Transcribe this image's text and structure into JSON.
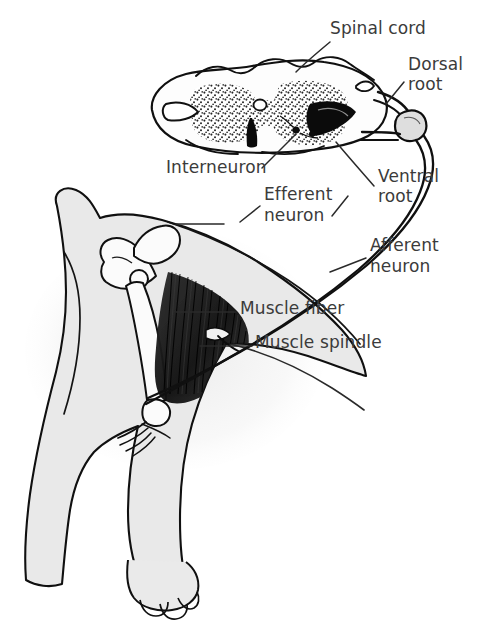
{
  "figure": {
    "width": 499,
    "height": 643,
    "background": "#ffffff",
    "style": "black-and-white line drawing with stipple shading"
  },
  "colors": {
    "outline": "#101010",
    "label_text": "#3b3b3b",
    "body_fill": "#e9e9e9",
    "bone_fill": "#fbfbfb",
    "cord_fill": "#fdfdfd",
    "gray_matter_stipple": "#1a1a1a",
    "muscle_dark": "#141414",
    "leader_line": "#2a2a2a",
    "background": "#ffffff"
  },
  "labels": [
    {
      "id": "spinal-cord",
      "text": "Spinal cord",
      "x": 330,
      "y": 34,
      "anchor": "start"
    },
    {
      "id": "dorsal-root-1",
      "text": "Dorsal",
      "x": 408,
      "y": 70,
      "anchor": "start"
    },
    {
      "id": "dorsal-root-2",
      "text": "root",
      "x": 408,
      "y": 90,
      "anchor": "start"
    },
    {
      "id": "interneuron",
      "text": "Interneuron",
      "x": 166,
      "y": 173,
      "anchor": "start"
    },
    {
      "id": "ventral-root-1",
      "text": "Ventral",
      "x": 378,
      "y": 182,
      "anchor": "start"
    },
    {
      "id": "ventral-root-2",
      "text": "root",
      "x": 378,
      "y": 202,
      "anchor": "start"
    },
    {
      "id": "efferent-1",
      "text": "Efferent",
      "x": 264,
      "y": 200,
      "anchor": "start"
    },
    {
      "id": "efferent-2",
      "text": "neuron",
      "x": 264,
      "y": 221,
      "anchor": "start"
    },
    {
      "id": "afferent-1",
      "text": "Afferent",
      "x": 370,
      "y": 251,
      "anchor": "start"
    },
    {
      "id": "afferent-2",
      "text": "neuron",
      "x": 370,
      "y": 272,
      "anchor": "start"
    },
    {
      "id": "muscle-fiber",
      "text": "Muscle fiber",
      "x": 240,
      "y": 314,
      "anchor": "start"
    },
    {
      "id": "muscle-spindle",
      "text": "Muscle spindle",
      "x": 255,
      "y": 348,
      "anchor": "start"
    }
  ],
  "structures": [
    {
      "id": "spinal-cord-section",
      "name": "spinal cord cross-section"
    },
    {
      "id": "gray-matter",
      "name": "butterfly-shaped gray matter (stippled)"
    },
    {
      "id": "central-canal",
      "name": "central canal"
    },
    {
      "id": "dorsal-root-ganglion",
      "name": "dorsal root ganglion"
    },
    {
      "id": "dorsal-root-fiber",
      "name": "dorsal root"
    },
    {
      "id": "ventral-root-fiber",
      "name": "ventral root"
    },
    {
      "id": "afferent-fiber",
      "name": "afferent (sensory) neuron"
    },
    {
      "id": "efferent-fiber",
      "name": "efferent (motor) neuron"
    },
    {
      "id": "animal-body",
      "name": "hind limb and hindquarters"
    },
    {
      "id": "pelvis-bone",
      "name": "pelvis"
    },
    {
      "id": "femur-bone",
      "name": "femur"
    },
    {
      "id": "tibia-bone",
      "name": "tibia"
    },
    {
      "id": "paw",
      "name": "paw with toes"
    },
    {
      "id": "muscle-mass",
      "name": "striated muscle belly"
    },
    {
      "id": "muscle-spindle-organ",
      "name": "muscle spindle"
    }
  ]
}
